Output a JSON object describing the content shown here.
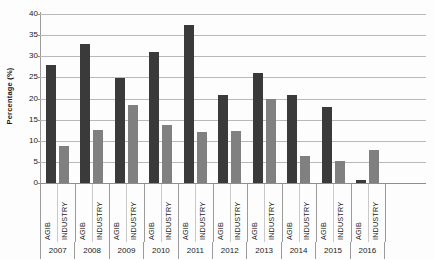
{
  "chart_data": {
    "type": "bar",
    "title": "",
    "xlabel": "",
    "ylabel": "Percentage (%)",
    "ylim": [
      0,
      40
    ],
    "ytick_step": 5,
    "yticks": [
      0,
      5,
      10,
      15,
      20,
      25,
      30,
      35,
      40
    ],
    "ytick_labels": [
      "0",
      "5",
      "10",
      "15",
      "20",
      "25",
      "30",
      "35",
      "40"
    ],
    "grid": "horizontal",
    "legend": "none",
    "categories": [
      "2007",
      "2008",
      "2009",
      "2010",
      "2011",
      "2012",
      "2013",
      "2014",
      "2015",
      "2016"
    ],
    "subcategories": [
      "AGIB",
      "INDUSTRY"
    ],
    "series": [
      {
        "name": "AGIB",
        "color": "#3a3a3a",
        "values": [
          28.0,
          33.0,
          24.8,
          31.0,
          37.5,
          20.8,
          26.0,
          20.8,
          18.0,
          0.6
        ]
      },
      {
        "name": "INDUSTRY",
        "color": "#808080",
        "values": [
          8.8,
          12.5,
          18.5,
          13.8,
          12.0,
          12.3,
          20.0,
          6.3,
          5.3,
          7.8
        ]
      }
    ]
  },
  "colors": {
    "agib": "#3a3a3a",
    "industry": "#808080",
    "gridline": "#b9b9b9",
    "axis": "#8e8e8e",
    "background": "#fdfdfd"
  }
}
